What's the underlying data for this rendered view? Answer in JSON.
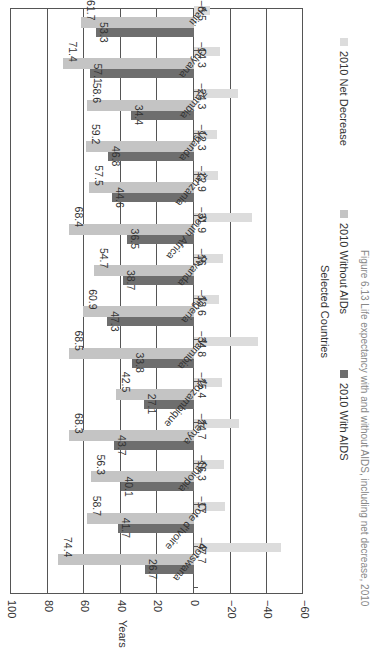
{
  "chart_data": {
    "type": "bar",
    "orientation": "vertical bars, figure rotated 90 degrees clockwise",
    "title": "",
    "xlabel": "Selected Countries",
    "ylabel": "Years",
    "ylim": [
      -60,
      100
    ],
    "yticks": [
      100,
      80,
      60,
      40,
      20,
      0,
      -20,
      -40,
      -60
    ],
    "grid": true,
    "legend_position": "bottom",
    "categories": [
      "Botswana",
      "Cote d'Ivoire",
      "Ethiopia",
      "Kenya",
      "Mozambique",
      "Namibia",
      "Nigeria",
      "Rwanda",
      "South Africa",
      "Tanzania",
      "Uganda",
      "Zambia",
      "Guyana",
      "Haiti"
    ],
    "series": [
      {
        "name": "2010 With AIDS",
        "color": "#6e6e6e",
        "values": [
          26.7,
          41.7,
          40.1,
          43.7,
          27.1,
          33.8,
          47.3,
          38.7,
          36.5,
          44.6,
          46.8,
          34.4,
          57.1,
          53.3
        ]
      },
      {
        "name": "2010 Without AIDs",
        "color": "#c4c4c4",
        "values": [
          74.4,
          58.7,
          56.3,
          68.3,
          42.5,
          68.5,
          60.9,
          54.7,
          68.4,
          57.5,
          59.2,
          58.6,
          71.4,
          61.7
        ]
      },
      {
        "name": "2010 Net Decrease",
        "color": "#dcdcdc",
        "values": [
          -47.7,
          -17,
          -16.3,
          -24.7,
          -15.4,
          -34.8,
          -13.6,
          -16,
          -31.9,
          -12.9,
          -12.3,
          -24.3,
          -14.3,
          -8.5
        ]
      }
    ],
    "value_labels": {
      "with_aids": [
        "26.7",
        "41.7",
        "40.1",
        "43.7",
        "27.1",
        "33.8",
        "47.3",
        "38.7",
        "36.5",
        "44.6",
        "46.8",
        "34.4",
        "57.1",
        "53.3"
      ],
      "without_aids": [
        "74.4",
        "58.7",
        "56.3",
        "68.3",
        "42.5",
        "68.5",
        "60.9",
        "54.7",
        "68.4",
        "57.5",
        "59.2",
        "58.6",
        "71.4",
        "61.7"
      ],
      "net_decrease": [
        "−47.7",
        "−17",
        "−16.3",
        "−24.7",
        "−15.4",
        "−34.8",
        "−13.6",
        "−16",
        "−31.9",
        "−12.9",
        "−12.3",
        "−24.3",
        "−14.3",
        "−8.5"
      ]
    },
    "ytick_labels": [
      "100",
      "80",
      "60",
      "40",
      "20",
      "0",
      "−20",
      "−40",
      "−60"
    ],
    "caption": "Figure 6.13  Life expectancy with and without AIDS, including net decrease, 2010"
  }
}
